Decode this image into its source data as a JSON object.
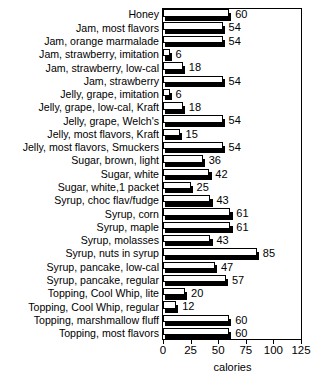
{
  "chart_data": {
    "type": "bar",
    "orientation": "horizontal",
    "title": "TOPPINGS AND JAMS",
    "xlabel": "calories",
    "ylabel": "",
    "xlim": [
      0,
      125
    ],
    "xticks": [
      0,
      25,
      50,
      75,
      100,
      125
    ],
    "xtick_labels": [
      "0",
      "25",
      "50",
      "75",
      "100",
      "125"
    ],
    "grid": false,
    "legend": false,
    "bar_style": "white fill, black outline, black drop shadow",
    "categories": [
      "Honey",
      "Jam, most flavors",
      "Jam, orange marmalade",
      "Jam, strawberry, imitation",
      "Jam, strawberry, low-cal",
      "Jam, strawberry",
      "Jelly, grape, imitation",
      "Jelly, grape, low-cal, Kraft",
      "Jelly, grape, Welch's",
      "Jelly, most flavors, Kraft",
      "Jelly, most flavors, Smuckers",
      "Sugar, brown, light",
      "Sugar, white",
      "Sugar, white,1 packet",
      "Syrup, choc flav/fudge",
      "Syrup, corn",
      "Syrup, maple",
      "Syrup, molasses",
      "Syrup, nuts in syrup",
      "Syrup, pancake, low-cal",
      "Syrup, pancake, regular",
      "Topping, Cool Whip, lite",
      "Topping, Cool Whip, regular",
      "Topping, marshmallow fluff",
      "Topping, most flavors"
    ],
    "values": [
      60,
      54,
      54,
      6,
      18,
      54,
      6,
      18,
      54,
      15,
      54,
      36,
      42,
      25,
      43,
      61,
      61,
      43,
      85,
      47,
      57,
      20,
      12,
      60,
      60
    ],
    "value_labels": [
      "60",
      "54",
      "54",
      "6",
      "18",
      "54",
      "6",
      "18",
      "54",
      "15",
      "54",
      "36",
      "42",
      "25",
      "43",
      "61",
      "61",
      "43",
      "85",
      "47",
      "57",
      "20",
      "12",
      "60",
      "60"
    ]
  }
}
